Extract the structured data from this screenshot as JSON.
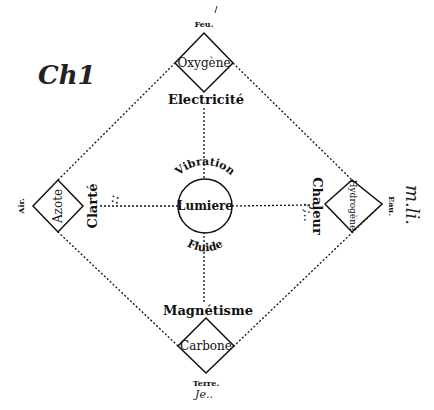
{
  "diagram": {
    "center": {
      "label": "Lumiere",
      "top_arc_label": "Vibration",
      "bottom_arc_label": "Fluide"
    },
    "nodes": {
      "top": {
        "element": "Oxygène",
        "outer_label": "Feu.",
        "inner_label": "Electricité"
      },
      "left": {
        "element": "Azote",
        "outer_label": "Air.",
        "inner_label": "Clarté"
      },
      "right": {
        "element": "Hydrogène",
        "outer_label": "Eau.",
        "inner_label": "Chaleur"
      },
      "bottom": {
        "element": "Carbone",
        "outer_label": "Terre.",
        "inner_label": "Magnétisme"
      }
    },
    "annotations": {
      "top_left_handwriting": "Ch1",
      "right_handwriting": "m.li.",
      "left_handwriting": "::",
      "bottom_handwriting": "Je..",
      "right_inner_handwriting": "?;.."
    },
    "colors": {
      "ink": "#111111",
      "background": "#ffffff"
    }
  }
}
